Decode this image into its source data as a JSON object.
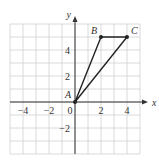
{
  "figure": {
    "type": "coordinate-plane",
    "axes": {
      "x_label": "x",
      "y_label": "y"
    },
    "x_ticks": [
      {
        "value": -4,
        "label": "−4"
      },
      {
        "value": -2,
        "label": "−2"
      },
      {
        "value": 0,
        "label": "0"
      },
      {
        "value": 2,
        "label": "2"
      },
      {
        "value": 4,
        "label": "4"
      }
    ],
    "y_ticks": [
      {
        "value": 4,
        "label": "4"
      },
      {
        "value": 2,
        "label": "2"
      },
      {
        "value": -2,
        "label": "−2"
      }
    ],
    "grid": {
      "x_range": [
        -5,
        5
      ],
      "y_range": [
        -4,
        6
      ],
      "step": 1
    },
    "points": [
      {
        "name": "A",
        "x": 0,
        "y": 0
      },
      {
        "name": "B",
        "x": 2,
        "y": 5
      },
      {
        "name": "C",
        "x": 4,
        "y": 5
      }
    ],
    "polygon": [
      "A",
      "B",
      "C"
    ],
    "colors": {
      "grid": "#d0d0d0",
      "axis": "#333333",
      "shape": "#222222"
    }
  }
}
